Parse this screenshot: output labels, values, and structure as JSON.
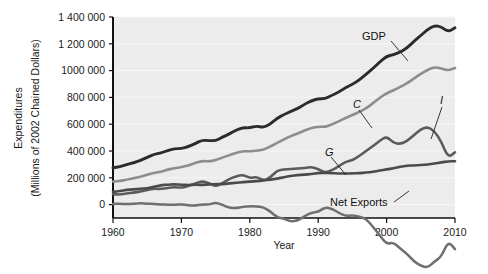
{
  "chart_data": {
    "type": "line",
    "title": "",
    "xlabel": "Year",
    "ylabel": "Expenditures (Millions of 2002 Chained Dollars)",
    "ylabel_line1": "Expenditures",
    "ylabel_line2": "(Millions of 2002 Chained Dollars)",
    "xlim": [
      1960,
      2010
    ],
    "ylim": [
      -100000,
      1400000
    ],
    "xticks": [
      1960,
      1970,
      1980,
      1990,
      2000,
      2010
    ],
    "xtick_labels": [
      "1960",
      "1970",
      "1980",
      "1990",
      "2000",
      "2010"
    ],
    "yticks": [
      0,
      200000,
      400000,
      600000,
      800000,
      1000000,
      1200000,
      1400000
    ],
    "ytick_labels": [
      "0",
      "200 000",
      "400 000",
      "600 000",
      "800 000",
      "1000 000",
      "1 200 000",
      "1 400 000"
    ],
    "grid": true,
    "legend_position": "inline-annotations",
    "plot_bgcolor": "#ececed",
    "colors": {
      "GDP": "#2b2b2b",
      "C": "#8d8d8d",
      "I": "#5b5b5b",
      "G": "#4a4a4a",
      "Net Exports": "#6f6f6f"
    },
    "x": [
      1960,
      1961,
      1962,
      1963,
      1964,
      1965,
      1966,
      1967,
      1968,
      1969,
      1970,
      1971,
      1972,
      1973,
      1974,
      1975,
      1976,
      1977,
      1978,
      1979,
      1980,
      1981,
      1982,
      1983,
      1984,
      1985,
      1986,
      1987,
      1988,
      1989,
      1990,
      1991,
      1992,
      1993,
      1994,
      1995,
      1996,
      1997,
      1998,
      1999,
      2000,
      2001,
      2002,
      2003,
      2004,
      2005,
      2006,
      2007,
      2008,
      2009,
      2010
    ],
    "series": [
      {
        "name": "GDP",
        "label": "GDP",
        "label_x": 2000,
        "label_y": 1330000,
        "values": [
          275000,
          282000,
          299000,
          312000,
          330000,
          352000,
          375000,
          385000,
          404000,
          417000,
          418000,
          432000,
          455000,
          481000,
          478000,
          477000,
          503000,
          526000,
          556000,
          574000,
          572000,
          587000,
          575000,
          601000,
          645000,
          672000,
          695000,
          718000,
          748000,
          775000,
          790000,
          789000,
          816000,
          839000,
          873000,
          897000,
          931000,
          973000,
          1016000,
          1065000,
          1107000,
          1118000,
          1138000,
          1170000,
          1218000,
          1262000,
          1307000,
          1336000,
          1327000,
          1288000,
          1320000
        ]
      },
      {
        "name": "C",
        "label": "C",
        "label_x": 1996,
        "label_y": 630000,
        "values": [
          172000,
          176000,
          186000,
          195000,
          208000,
          223000,
          237000,
          246000,
          261000,
          272000,
          279000,
          292000,
          311000,
          326000,
          322000,
          331000,
          351000,
          369000,
          387000,
          399000,
          397000,
          403000,
          409000,
          434000,
          459000,
          487000,
          512000,
          531000,
          553000,
          571000,
          582000,
          580000,
          598000,
          621000,
          647000,
          668000,
          692000,
          718000,
          756000,
          797000,
          831000,
          853000,
          878000,
          906000,
          941000,
          976000,
          1005000,
          1026000,
          1017000,
          1000000,
          1020000
        ]
      },
      {
        "name": "I",
        "label": "I",
        "label_x": 2007,
        "label_y": 420000,
        "values": [
          78000,
          74000,
          83000,
          89000,
          97000,
          110000,
          119000,
          116000,
          124000,
          131000,
          125000,
          139000,
          157000,
          175000,
          163000,
          134000,
          161000,
          190000,
          212000,
          223000,
          197000,
          208000,
          179000,
          202000,
          255000,
          262000,
          265000,
          269000,
          274000,
          281000,
          267000,
          236000,
          257000,
          285000,
          321000,
          331000,
          363000,
          400000,
          437000,
          476000,
          510000,
          459000,
          452000,
          474000,
          519000,
          562000,
          580000,
          548000,
          470000,
          350000,
          390000
        ]
      },
      {
        "name": "G",
        "label": "G",
        "label_x": 1992,
        "label_y": 252000,
        "values": [
          95000,
          101000,
          110000,
          113000,
          118000,
          122000,
          134000,
          145000,
          150000,
          151000,
          148000,
          146000,
          148000,
          147000,
          151000,
          153000,
          153000,
          157000,
          163000,
          167000,
          172000,
          174000,
          180000,
          186000,
          194000,
          205000,
          214000,
          220000,
          223000,
          228000,
          236000,
          237000,
          235000,
          232000,
          232000,
          233000,
          235000,
          239000,
          244000,
          254000,
          262000,
          271000,
          283000,
          290000,
          293000,
          295000,
          300000,
          306000,
          316000,
          322000,
          324000
        ]
      },
      {
        "name": "Net Exports",
        "label": "Net Exports",
        "label_x": 1996,
        "label_y": -58000,
        "values": [
          5000,
          6000,
          4000,
          6000,
          10000,
          8000,
          4000,
          3000,
          -2000,
          -2000,
          2000,
          -4000,
          -9000,
          2000,
          -1000,
          16000,
          -2000,
          -24000,
          -27000,
          -17000,
          -13000,
          -13000,
          -20000,
          -52000,
          -95000,
          -105000,
          -126000,
          -120000,
          -86000,
          -60000,
          -55000,
          -20000,
          -30000,
          -61000,
          -86000,
          -79000,
          -89000,
          -105000,
          -166000,
          -228000,
          -295000,
          -282000,
          -328000,
          -367000,
          -425000,
          -456000,
          -471000,
          -425000,
          -389000,
          -274000,
          -332000
        ]
      }
    ],
    "annotations": [
      {
        "name": "GDP",
        "text": "GDP",
        "italic": false
      },
      {
        "name": "C",
        "text": "C",
        "italic": true
      },
      {
        "name": "I",
        "text": "I",
        "italic": true
      },
      {
        "name": "G",
        "text": "G",
        "italic": true
      },
      {
        "name": "Net Exports",
        "text": "Net Exports",
        "italic": false
      }
    ]
  }
}
